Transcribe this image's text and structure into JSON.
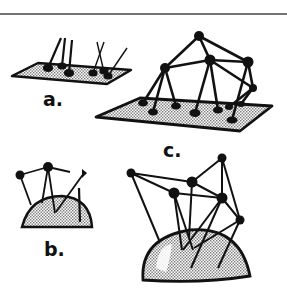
{
  "figure": {
    "panels": [
      {
        "id": "a",
        "label": "a.",
        "description": "Flat stippled plate with five sparse rod-like pegs"
      },
      {
        "id": "b",
        "label": "b.",
        "description": "Hemispherical stippled dome with a few connected nodes above"
      },
      {
        "id": "c",
        "label": "c.",
        "description": "Flat plate and large shaded dome supporting a network of connected nodes"
      }
    ],
    "colors": {
      "ink": "#111111",
      "paper": "#ffffff",
      "stipple": "#9a9a9a",
      "rule": "#444444"
    }
  }
}
